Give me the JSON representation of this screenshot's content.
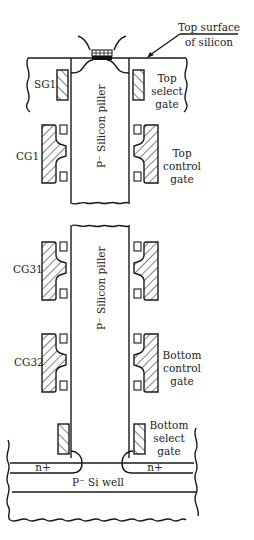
{
  "diagram": {
    "labels": {
      "top_surface": [
        "Top surface",
        "of silicon"
      ],
      "sg1": "SG1",
      "top_select_gate": [
        "Top",
        "select",
        "gate"
      ],
      "cg1": "CG1",
      "top_control_gate": [
        "Top",
        "control",
        "gate"
      ],
      "pillar_upper": "P⁻ Silicon piller",
      "pillar_lower": "P⁻ Silicon piller",
      "cg31": "CG31",
      "cg32": "CG32",
      "bottom_control_gate": [
        "Bottom",
        "control",
        "gate"
      ],
      "bottom_select_gate": [
        "Bottom",
        "select",
        "gate"
      ],
      "n_plus_left": "n+",
      "n_plus_right": "n+",
      "si_well": "P⁻ Si well"
    },
    "colors": {
      "line": "#1a1a1a",
      "background": "#ffffff"
    }
  }
}
